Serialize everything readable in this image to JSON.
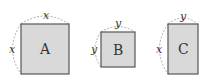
{
  "shapes": [
    {
      "name": "A",
      "label": "A",
      "top_dimension": "x",
      "side_dimension": "x"
    },
    {
      "name": "B",
      "label": "B",
      "top_dimension": "y",
      "side_dimension": "y"
    },
    {
      "name": "C",
      "label": "C",
      "top_dimension": "y",
      "side_dimension": "x"
    }
  ],
  "colors": {
    "fill": "#d9d9d9",
    "stroke": "#555555",
    "dash": "#999999"
  }
}
